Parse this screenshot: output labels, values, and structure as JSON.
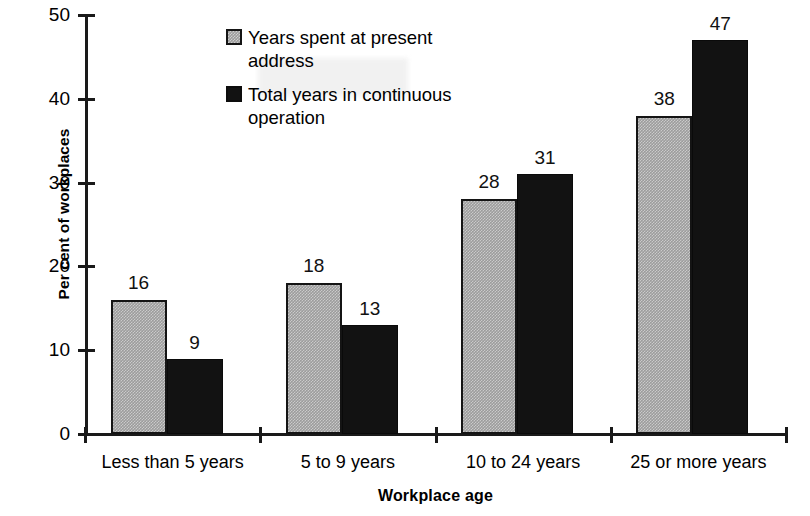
{
  "chart_data": {
    "type": "bar",
    "title": "",
    "clipped_title_remnant": "g p g",
    "xlabel": "Workplace age",
    "ylabel": "Per cent of workplaces",
    "categories": [
      "Less than 5 years",
      "5 to 9 years",
      "10 to 24 years",
      "25 or more years"
    ],
    "series": [
      {
        "name": "Years spent at present address",
        "values": [
          16,
          18,
          28,
          38
        ],
        "color": "#9c9c9c"
      },
      {
        "name": "Total years in continuous operation",
        "values": [
          9,
          13,
          31,
          47
        ],
        "color": "#121212"
      }
    ],
    "ylim": [
      0,
      50
    ],
    "yticks": [
      0,
      10,
      20,
      30,
      40,
      50
    ],
    "ytick_labels": [
      "0",
      "10",
      "20",
      "30",
      "40",
      "50"
    ],
    "grid": false,
    "legend_position": "top-center",
    "value_labels_shown": true
  },
  "legend": {
    "items": [
      {
        "label": "Years spent at present address",
        "swatch": "gray-dithered-square"
      },
      {
        "label": "Total years in continuous operation",
        "swatch": "black-square"
      }
    ]
  },
  "axes": {
    "y_title": "Per cent of workplaces",
    "x_title": "Workplace age"
  },
  "colors": {
    "series_a": "#9c9c9c",
    "series_b": "#121212",
    "axis": "#1a1a1a",
    "text": "#000000",
    "background": "#ffffff"
  }
}
